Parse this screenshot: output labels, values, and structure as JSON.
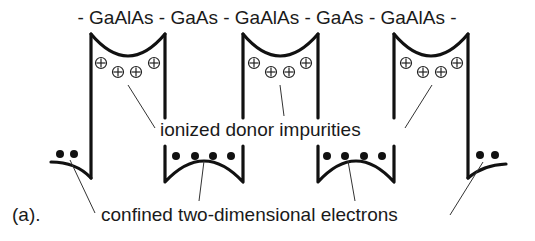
{
  "figure": {
    "panel_label": "(a).",
    "layer_sequence": "- GaAlAs - GaAs - GaAlAs - GaAs - GaAlAs -",
    "layers": [
      "GaAlAs",
      "GaAs",
      "GaAlAs",
      "GaAs",
      "GaAlAs"
    ],
    "annotations": {
      "donors": "ionized donor impurities",
      "electrons": "confined two-dimensional electrons"
    },
    "barriers": [
      {
        "material": "GaAlAs",
        "ionized_donors": 4
      },
      {
        "material": "GaAlAs",
        "ionized_donors": 4
      },
      {
        "material": "GaAlAs",
        "ionized_donors": 4
      }
    ],
    "wells": [
      {
        "position": "left-edge",
        "electrons": 2
      },
      {
        "material": "GaAs",
        "electrons": 4
      },
      {
        "material": "GaAs",
        "electrons": 4
      },
      {
        "position": "right-edge",
        "electrons": 2
      }
    ],
    "icons": {
      "donor": "circled-plus-icon",
      "electron": "filled-dot-icon"
    },
    "colors": {
      "line": "#111111",
      "background": "#ffffff"
    }
  }
}
